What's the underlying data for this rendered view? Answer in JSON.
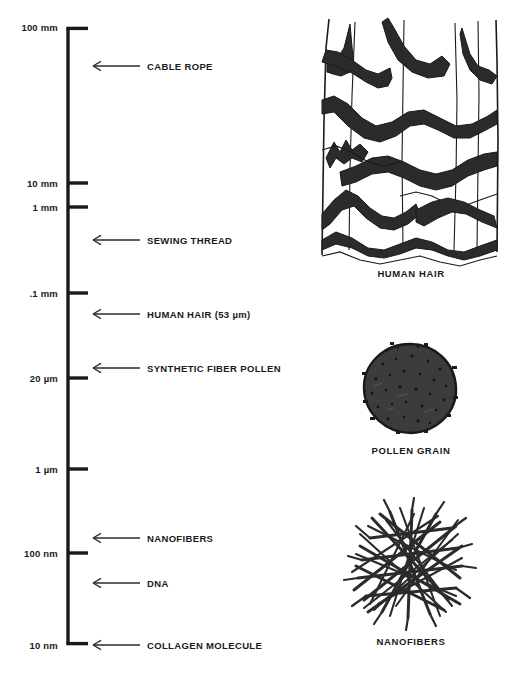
{
  "figure": {
    "background_color": "#ffffff",
    "ink_color": "#1a1a1a"
  },
  "chart_data": {
    "type": "scatter",
    "title": "",
    "xlabel": "",
    "ylabel": "",
    "orientation": "vertical-log-scale",
    "grid": false,
    "legend": false,
    "axis_scale": "logarithmic",
    "axis_range_top": "100 mm",
    "axis_range_bottom": "10 nm",
    "tick_labels": [
      "100 mm",
      "10 mm",
      "1 mm",
      ".1 mm",
      "20 µm",
      "1 µm",
      "100 nm",
      "10 nm"
    ],
    "ticks": [
      {
        "label": "100 mm",
        "y": 27,
        "value_nm": 100000000
      },
      {
        "label": "10 mm",
        "y": 183,
        "value_nm": 10000000
      },
      {
        "label": "1 mm",
        "y": 207,
        "value_nm": 1000000
      },
      {
        "label": ".1 mm",
        "y": 293,
        "value_nm": 100000
      },
      {
        "label": "20 µm",
        "y": 378,
        "value_nm": 20000
      },
      {
        "label": "1 µm",
        "y": 469,
        "value_nm": 1000
      },
      {
        "label": "100 nm",
        "y": 553,
        "value_nm": 100
      },
      {
        "label": "10 nm",
        "y": 645,
        "value_nm": 10
      }
    ],
    "annotations": [
      {
        "label": "CABLE ROPE",
        "y": 66
      },
      {
        "label": "SEWING THREAD",
        "y": 240
      },
      {
        "label": "HUMAN HAIR (53 µm)",
        "y": 314
      },
      {
        "label": "SYNTHETIC FIBER POLLEN",
        "y": 368
      },
      {
        "label": "NANOFIBERS",
        "y": 538
      },
      {
        "label": "DNA",
        "y": 583
      },
      {
        "label": "COLLAGEN MOLECULE",
        "y": 645
      }
    ]
  },
  "illustrations": [
    {
      "caption": "HUMAN HAIR",
      "caption_x": 411,
      "caption_y": 273,
      "name": "human-hair"
    },
    {
      "caption": "POLLEN GRAIN",
      "caption_x": 411,
      "caption_y": 450,
      "name": "pollen-grain"
    },
    {
      "caption": "NANOFIBERS",
      "caption_x": 411,
      "caption_y": 641,
      "name": "nanofibers"
    }
  ]
}
